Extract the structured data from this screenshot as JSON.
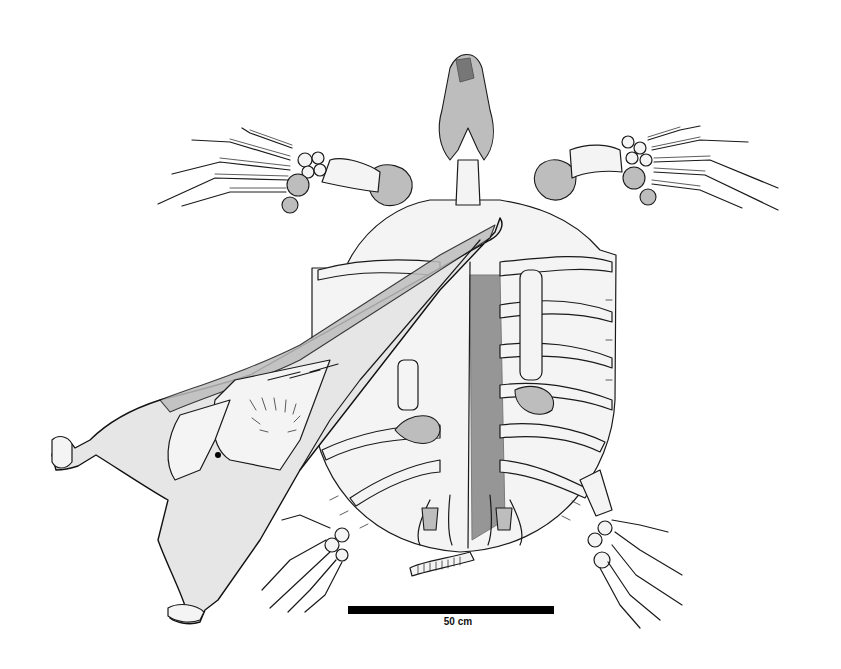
{
  "figure": {
    "elements": [
      "turtle-skull",
      "left-fore-flipper",
      "right-fore-flipper",
      "carapace",
      "left-hind-flipper",
      "right-hind-flipper",
      "tail-vertebrae",
      "pterosaur-skull"
    ],
    "colors": {
      "background": "#ffffff",
      "ink": "#1a1a1a",
      "scale_bar": "#000000"
    }
  },
  "scale_bar": {
    "label": "50 cm"
  }
}
